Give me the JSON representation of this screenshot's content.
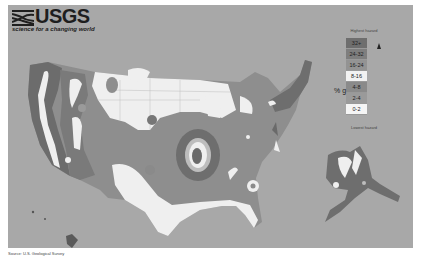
{
  "header": {
    "logo_text": "USGS",
    "tagline": "science for a changing world"
  },
  "legend": {
    "top_label": "Highest hazard",
    "bottom_label": "Lowest hazard",
    "unit_label": "% g",
    "items": [
      {
        "label": "32+",
        "color": "#6e6e6e"
      },
      {
        "label": "24-32",
        "color": "#7e7e7e"
      },
      {
        "label": "16-24",
        "color": "#939393"
      },
      {
        "label": "8-16",
        "color": "#f2f2f2"
      },
      {
        "label": "4-8",
        "color": "#8a8a8a"
      },
      {
        "label": "2-4",
        "color": "#9a9a9a"
      },
      {
        "label": "0-2",
        "color": "#f5f5f5"
      }
    ]
  },
  "map": {
    "title": "Seismic hazard map",
    "regions": [
      "Contiguous United States",
      "Alaska",
      "Hawaii"
    ],
    "colors": {
      "background": "#a8a8a8",
      "low": "#f0f0f0",
      "mid": "#8f8f8f",
      "high": "#6a6a6a"
    }
  },
  "caption": "Source: U.S. Geological Survey"
}
